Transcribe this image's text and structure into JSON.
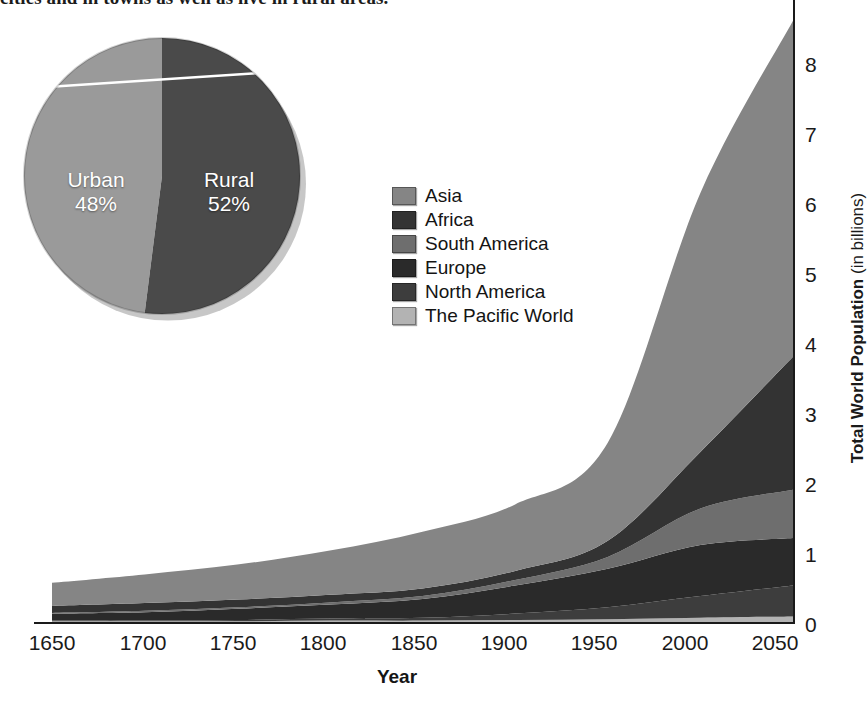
{
  "caption": {
    "text": "cities and in towns as well as live in rural areas."
  },
  "colors": {
    "asia": "#858585",
    "africa": "#333333",
    "south_america": "#6e6e6e",
    "europe": "#2a2a2a",
    "north_america": "#3d3d3d",
    "pacific_world": "#b3b3b3",
    "urban": "#9a9a9a",
    "rural": "#4a4a4a",
    "axis": "#1a1a1a"
  },
  "legend": {
    "position": "inside-upper-middle",
    "items": [
      {
        "label": "Asia",
        "color": "#858585"
      },
      {
        "label": "Africa",
        "color": "#333333"
      },
      {
        "label": "South America",
        "color": "#6e6e6e"
      },
      {
        "label": "Europe",
        "color": "#2a2a2a"
      },
      {
        "label": "North America",
        "color": "#3d3d3d"
      },
      {
        "label": "The Pacific World",
        "color": "#b3b3b3"
      }
    ]
  },
  "pie": {
    "title": "",
    "slices": [
      {
        "label": "Urban",
        "value": 48,
        "display": "48%",
        "color": "#9a9a9a"
      },
      {
        "label": "Rural",
        "value": 52,
        "display": "52%",
        "color": "#4a4a4a"
      }
    ]
  },
  "axes": {
    "y_label_strong": "Total World Population",
    "y_label_light": " (in billions)",
    "y_ticks": [
      "0",
      "1",
      "2",
      "3",
      "4",
      "5",
      "6",
      "7",
      "8"
    ],
    "x_label": "Year",
    "x_ticks": [
      "1650",
      "1700",
      "1750",
      "1800",
      "1850",
      "1900",
      "1950",
      "2000",
      "2050"
    ]
  },
  "chart_data": {
    "type": "area",
    "title": "",
    "subtitle": "",
    "xlabel": "Year",
    "ylabel": "Total World Population (in billions)",
    "xlim": [
      1650,
      2050
    ],
    "ylim": [
      0,
      8.6
    ],
    "grid": false,
    "stacked": true,
    "legend_position": "inside-upper-middle",
    "x": [
      1650,
      1700,
      1750,
      1800,
      1850,
      1900,
      1950,
      2000,
      2050
    ],
    "series": [
      {
        "name": "The Pacific World",
        "color": "#b3b3b3",
        "values": [
          0.01,
          0.01,
          0.01,
          0.02,
          0.02,
          0.03,
          0.04,
          0.06,
          0.08
        ]
      },
      {
        "name": "North America",
        "color": "#3d3d3d",
        "values": [
          0.01,
          0.01,
          0.02,
          0.03,
          0.04,
          0.09,
          0.17,
          0.31,
          0.44
        ]
      },
      {
        "name": "Europe",
        "color": "#2a2a2a",
        "values": [
          0.1,
          0.12,
          0.16,
          0.2,
          0.27,
          0.4,
          0.55,
          0.73,
          0.68
        ]
      },
      {
        "name": "South America",
        "color": "#6e6e6e",
        "values": [
          0.01,
          0.02,
          0.02,
          0.03,
          0.04,
          0.08,
          0.17,
          0.52,
          0.69
        ]
      },
      {
        "name": "Africa",
        "color": "#333333",
        "values": [
          0.1,
          0.11,
          0.11,
          0.11,
          0.11,
          0.13,
          0.23,
          0.81,
          1.9
        ]
      },
      {
        "name": "Asia",
        "color": "#858585",
        "values": [
          0.33,
          0.41,
          0.5,
          0.63,
          0.81,
          0.95,
          1.4,
          3.7,
          4.8
        ]
      }
    ],
    "totals": [
      0.56,
      0.68,
      0.82,
      1.02,
      1.29,
      1.68,
      2.56,
      6.13,
      8.59
    ],
    "annotations": [
      {
        "text": "Urban 48%",
        "type": "pie-slice"
      },
      {
        "text": "Rural 52%",
        "type": "pie-slice"
      }
    ]
  }
}
